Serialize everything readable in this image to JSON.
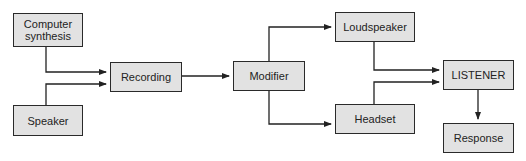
{
  "diagram": {
    "nodes": [
      {
        "id": "computer_synthesis",
        "label": "Computer\nsynthesis",
        "x": 13,
        "y": 13,
        "w": 70,
        "h": 34
      },
      {
        "id": "speaker",
        "label": "Speaker",
        "x": 13,
        "y": 105,
        "w": 70,
        "h": 31
      },
      {
        "id": "recording",
        "label": "Recording",
        "x": 110,
        "y": 62,
        "w": 72,
        "h": 30
      },
      {
        "id": "modifier",
        "label": "Modifier",
        "x": 233,
        "y": 61,
        "w": 72,
        "h": 30
      },
      {
        "id": "loudspeaker",
        "label": "Loudspeaker",
        "x": 335,
        "y": 12,
        "w": 80,
        "h": 30
      },
      {
        "id": "headset",
        "label": "Headset",
        "x": 335,
        "y": 104,
        "w": 80,
        "h": 30
      },
      {
        "id": "listener",
        "label": "LISTENER",
        "x": 443,
        "y": 60,
        "w": 71,
        "h": 30
      },
      {
        "id": "response",
        "label": "Response",
        "x": 443,
        "y": 123,
        "w": 71,
        "h": 30
      }
    ],
    "edges": [
      {
        "from": "computer_synthesis",
        "to": "recording"
      },
      {
        "from": "speaker",
        "to": "recording"
      },
      {
        "from": "recording",
        "to": "modifier"
      },
      {
        "from": "modifier",
        "to": "loudspeaker"
      },
      {
        "from": "modifier",
        "to": "headset"
      },
      {
        "from": "loudspeaker",
        "to": "listener"
      },
      {
        "from": "headset",
        "to": "listener"
      },
      {
        "from": "listener",
        "to": "response"
      }
    ],
    "colors": {
      "box_fill": "#e2e2e2",
      "box_border": "#2a2a2a",
      "line": "#222222",
      "text": "#222222"
    }
  }
}
